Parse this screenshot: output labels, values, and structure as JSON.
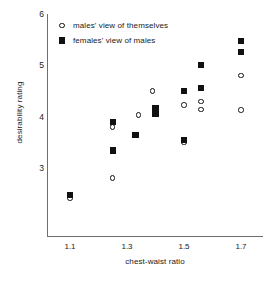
{
  "chart_data": {
    "type": "scatter",
    "title": "",
    "xlabel": "chest-waist ratio",
    "ylabel": "desirability rating",
    "xlim": [
      1.02,
      1.78
    ],
    "ylim": [
      2.25,
      6.0
    ],
    "xticks": [
      "1.1",
      "1.3",
      "1.5",
      "1.7"
    ],
    "xtick_values": [
      1.1,
      1.3,
      1.5,
      1.7
    ],
    "yticks": [
      "3",
      "4",
      "5",
      "6"
    ],
    "ytick_values": [
      3,
      4,
      5,
      6
    ],
    "grid": false,
    "legend_position": "top-left",
    "series": [
      {
        "name": "males' view of themselves",
        "marker": "open-circle",
        "color": "#111111",
        "points": [
          {
            "x": 1.1,
            "y": 2.41
          },
          {
            "x": 1.25,
            "y": 3.8
          },
          {
            "x": 1.25,
            "y": 2.8
          },
          {
            "x": 1.34,
            "y": 4.03
          },
          {
            "x": 1.39,
            "y": 4.5
          },
          {
            "x": 1.4,
            "y": 4.05
          },
          {
            "x": 1.5,
            "y": 4.23
          },
          {
            "x": 1.5,
            "y": 3.5
          },
          {
            "x": 1.56,
            "y": 4.3
          },
          {
            "x": 1.56,
            "y": 4.14
          },
          {
            "x": 1.7,
            "y": 4.8
          },
          {
            "x": 1.7,
            "y": 4.13
          }
        ]
      },
      {
        "name": "females' view of males",
        "marker": "filled-square",
        "color": "#111111",
        "points": [
          {
            "x": 1.1,
            "y": 2.47
          },
          {
            "x": 1.25,
            "y": 3.89
          },
          {
            "x": 1.25,
            "y": 3.34
          },
          {
            "x": 1.33,
            "y": 3.64
          },
          {
            "x": 1.4,
            "y": 4.17
          },
          {
            "x": 1.4,
            "y": 4.06
          },
          {
            "x": 1.5,
            "y": 4.5
          },
          {
            "x": 1.5,
            "y": 3.55
          },
          {
            "x": 1.56,
            "y": 5.0
          },
          {
            "x": 1.56,
            "y": 4.56
          },
          {
            "x": 1.7,
            "y": 5.48
          },
          {
            "x": 1.7,
            "y": 5.26
          }
        ]
      }
    ]
  },
  "legend": {
    "items": [
      {
        "label": "males' view of themselves",
        "marker": "open-circle"
      },
      {
        "label": "females' view of males",
        "marker": "filled-square"
      }
    ]
  }
}
